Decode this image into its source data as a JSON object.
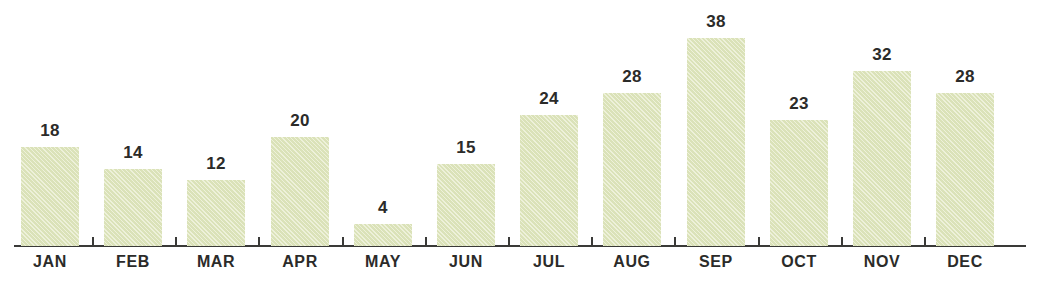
{
  "chart_data": {
    "type": "bar",
    "title": "",
    "subtitle": "",
    "xlabel": "",
    "ylabel": "",
    "categories": [
      "JAN",
      "FEB",
      "MAR",
      "APR",
      "MAY",
      "JUN",
      "JUL",
      "AUG",
      "SEP",
      "OCT",
      "NOV",
      "DEC"
    ],
    "values": [
      18,
      14,
      12,
      20,
      4,
      15,
      24,
      28,
      38,
      23,
      32,
      28
    ],
    "data_labels": [
      "18",
      "14",
      "12",
      "20",
      "4",
      "15",
      "24",
      "28",
      "38",
      "23",
      "32",
      "28"
    ],
    "ylim": [
      0,
      38
    ],
    "grid": false,
    "legend": null,
    "series": [
      {
        "name": "",
        "values": [
          18,
          14,
          12,
          20,
          4,
          15,
          24,
          28,
          38,
          23,
          32,
          28
        ]
      }
    ],
    "colors": {
      "bar_fill": "#e2e8c2",
      "axis": "#3a3a38",
      "label_text": "#2b2b29",
      "background": "#ffffff"
    },
    "axis": {
      "x_axis_visible": true,
      "y_axis_visible": false,
      "tick_marks": "between-categories"
    }
  }
}
